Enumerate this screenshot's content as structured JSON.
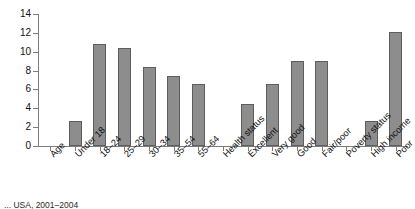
{
  "chart_data": {
    "type": "bar",
    "title": "",
    "subtitle": "",
    "xlabel": "",
    "ylabel": "",
    "ylim": [
      0,
      14
    ],
    "ytick_step": 2,
    "yticks": [
      "0",
      "2",
      "4",
      "6",
      "8",
      "10",
      "12",
      "14"
    ],
    "grid": false,
    "legend": null,
    "bar_color": "#8d8d8d",
    "bar_border_color": "#5d5d5d",
    "axis_color": "#7d7d7d",
    "categories": [
      "Age",
      "Under 18",
      "18–24",
      "25–29",
      "30–34",
      "35–54",
      "55–64",
      "Health status",
      "Excellent",
      "Very good",
      "Good",
      "Fair/poor",
      "Poverty status",
      "High income",
      "Poor"
    ],
    "values": [
      null,
      2.6,
      10.8,
      10.4,
      8.4,
      7.4,
      6.6,
      null,
      4.5,
      6.6,
      9.0,
      9.0,
      null,
      2.6,
      12.1
    ],
    "group_headers": [
      "Age",
      "Health status",
      "Poverty status"
    ]
  },
  "caption": {
    "text": "... USA, 2001–2004"
  }
}
